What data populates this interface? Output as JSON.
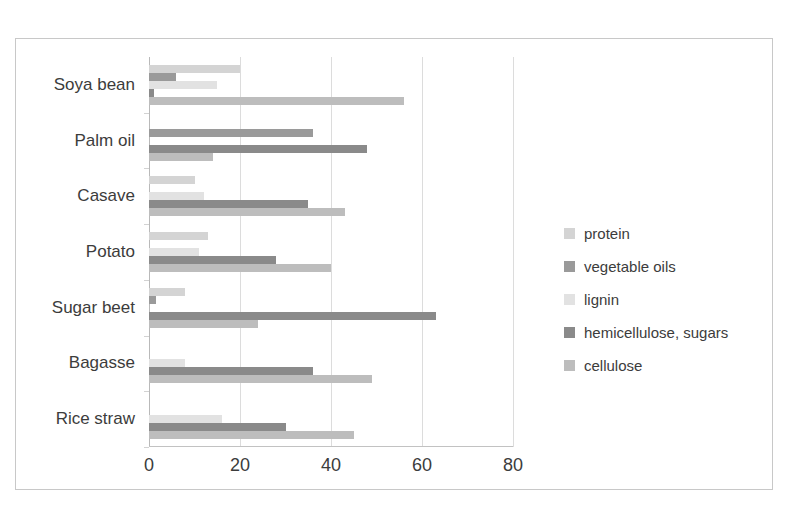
{
  "top_text": "",
  "chart_data": {
    "type": "bar",
    "orientation": "horizontal",
    "title": "",
    "subtitle": "",
    "xlabel": "",
    "ylabel": "",
    "xlim": [
      0,
      80
    ],
    "xticks": [
      0,
      20,
      40,
      60,
      80
    ],
    "grid": "vertical",
    "legend_position": "right",
    "categories": [
      "Soya bean",
      "Palm oil",
      "Casave",
      "Potato",
      "Sugar beet",
      "Bagasse",
      "Rice straw"
    ],
    "series": [
      {
        "name": "protein",
        "color": "#d4d4d4",
        "values": [
          20,
          0,
          10,
          13,
          8,
          0,
          0
        ]
      },
      {
        "name": "vegetable oils",
        "color": "#9a9a9a",
        "values": [
          6,
          36,
          0,
          0,
          1.5,
          0,
          0
        ]
      },
      {
        "name": "lignin",
        "color": "#e2e2e2",
        "values": [
          15,
          0,
          12,
          11,
          0,
          8,
          16
        ]
      },
      {
        "name": "hemicellulose, sugars",
        "color": "#8a8a8a",
        "values": [
          1,
          48,
          35,
          28,
          63,
          36,
          30
        ]
      },
      {
        "name": "cellulose",
        "color": "#bdbdbd",
        "values": [
          56,
          14,
          43,
          40,
          24,
          49,
          45
        ]
      }
    ]
  }
}
